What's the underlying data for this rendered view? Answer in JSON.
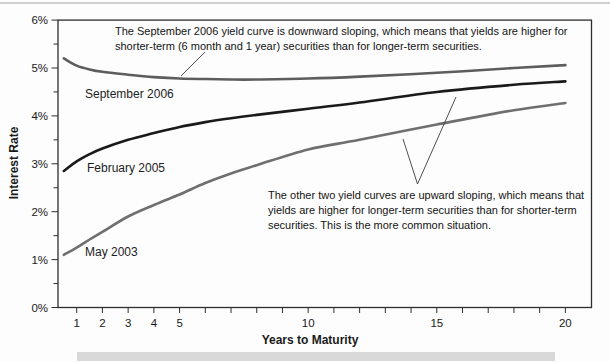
{
  "chart_data": {
    "type": "line",
    "title": "",
    "xlabel": "Years to Maturity",
    "ylabel": "Interest Rate",
    "xlim": [
      0.45,
      21
    ],
    "ylim": [
      0,
      6
    ],
    "grid": false,
    "legend_position": "inline-curve-labels",
    "x_major_tick_values": [
      1,
      2,
      3,
      4,
      5,
      10,
      15,
      20
    ],
    "x_major_tick_labels": [
      "1",
      "2",
      "3",
      "4",
      "5",
      "10",
      "15",
      "20"
    ],
    "x_minor_tick_values": [
      1,
      2,
      3,
      4,
      5,
      6,
      7,
      8,
      9,
      10,
      11,
      12,
      13,
      14,
      15,
      16,
      17,
      18,
      19,
      20
    ],
    "y_tick_values": [
      0,
      1,
      2,
      3,
      4,
      5,
      6
    ],
    "y_tick_labels": [
      "0%",
      "1%",
      "2%",
      "3%",
      "4%",
      "5%",
      "6%"
    ],
    "y_minor_tick_values": [
      0.5,
      1.5,
      2.5,
      3.5,
      4.5,
      5.5
    ],
    "x": [
      0.5,
      1,
      1.5,
      2,
      3,
      4,
      5,
      6,
      7,
      8,
      10,
      12,
      15,
      18,
      20
    ],
    "series": [
      {
        "name": "September 2006",
        "color": "#5d5d5d",
        "values": [
          5.2,
          5.05,
          4.97,
          4.92,
          4.86,
          4.81,
          4.78,
          4.77,
          4.76,
          4.76,
          4.78,
          4.82,
          4.9,
          5.0,
          5.06
        ]
      },
      {
        "name": "February 2005",
        "color": "#1a1a1a",
        "values": [
          2.85,
          3.05,
          3.2,
          3.32,
          3.5,
          3.64,
          3.77,
          3.87,
          3.95,
          4.02,
          4.15,
          4.28,
          4.5,
          4.65,
          4.72
        ]
      },
      {
        "name": "May 2003",
        "color": "#6f6f6f",
        "values": [
          1.1,
          1.25,
          1.42,
          1.58,
          1.9,
          2.14,
          2.36,
          2.6,
          2.8,
          2.97,
          3.3,
          3.5,
          3.82,
          4.12,
          4.27
        ]
      }
    ],
    "annotations": [
      {
        "text": "The September 2006 yield curve is downward sloping, which means that yields are higher for shorter-term (6 month and 1 year) securities than for longer-term securities.",
        "points_to": "September 2006 curve"
      },
      {
        "text": "The other two yield curves are upward sloping, which means that yields are higher for longer-term securities than for shorter-term securities. This is the more common situation.",
        "points_to": "February 2005 and May 2003 curves"
      }
    ]
  }
}
